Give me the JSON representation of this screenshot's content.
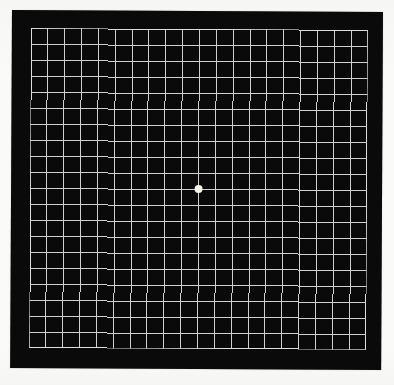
{
  "figure": {
    "name": "amsler-grid-chart",
    "description_label": "Amsler grid",
    "grid": {
      "columns": 20,
      "rows": 20,
      "line_thickness_px": 1
    },
    "fixation_dot": {
      "shape": "circle",
      "diameter_px": 8,
      "position": "center-intersection"
    },
    "colors": {
      "page_background": "#fafaf8",
      "square_background": "#0a0a0a",
      "grid_line": "#cfcfcf",
      "grid_border": "#dedede",
      "fixation_dot": "#f6f3e7"
    }
  }
}
